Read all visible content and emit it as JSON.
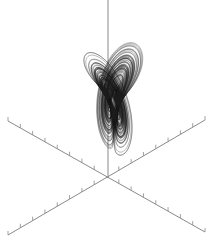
{
  "chart_data": {
    "type": "line",
    "title": "",
    "subtitle": "",
    "xlabel": "",
    "ylabel": "",
    "zlabel": "",
    "legend": [],
    "grid": false,
    "parameters": {
      "sigma": 10,
      "rho": 28,
      "beta": 2.6667
    },
    "projection": {
      "origin_px": [
        108,
        178
      ],
      "axis_vertical_top_px": [
        108,
        0
      ],
      "axis_a_px": [
        [
          8,
          121
        ],
        [
          205,
          232
        ]
      ],
      "axis_b_px": [
        [
          8,
          235
        ],
        [
          205,
          120
        ]
      ],
      "tick_spacing_px": 14,
      "tick_length_px": 4
    },
    "colors": {
      "trajectory": "#1a1a1a",
      "axes": "#8a8a8a",
      "background": "#ffffff"
    },
    "series": [
      {
        "name": "trajectory",
        "lobes": [
          "left",
          "right"
        ],
        "left_lobe_center_px": [
          75,
          105
        ],
        "right_lobe_center_px": [
          160,
          95
        ]
      }
    ]
  }
}
